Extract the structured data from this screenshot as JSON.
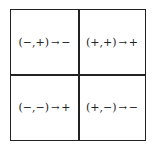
{
  "diagram": {
    "cells": [
      {
        "position": "top-left",
        "input": "(−,+)",
        "arrow": "→",
        "output": "−"
      },
      {
        "position": "top-right",
        "input": "(+,+)",
        "arrow": "→",
        "output": "+"
      },
      {
        "position": "bottom-left",
        "input": "(−,−)",
        "arrow": "→",
        "output": "+"
      },
      {
        "position": "bottom-right",
        "input": "(+,−)",
        "arrow": "→",
        "output": "−"
      }
    ]
  }
}
